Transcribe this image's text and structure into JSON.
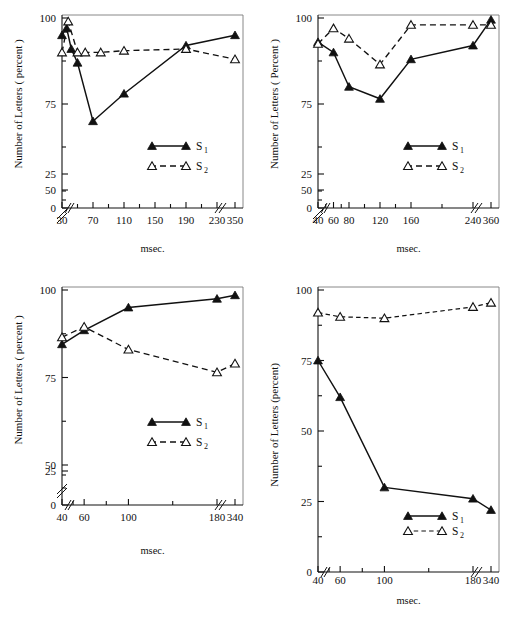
{
  "figure": {
    "background": "#ffffff",
    "panel_count": 4,
    "marker_colors": {
      "s1_fill": "#111111",
      "s2_fill": "#ffffff",
      "stroke": "#111111"
    }
  },
  "legend": {
    "s1_label": "S",
    "s1_sub": "1",
    "s2_label": "S",
    "s2_sub": "2"
  },
  "chart_data": [
    {
      "id": "panel-top-left",
      "type": "line",
      "title": "",
      "xlabel": "msec.",
      "ylabel": "Number of Letters ( percent )",
      "xticks": [
        "30",
        "70",
        "110",
        "150",
        "190",
        "230",
        "350"
      ],
      "xtick_values": [
        30,
        70,
        110,
        150,
        190,
        230,
        350
      ],
      "yticks": [
        "0",
        "25",
        "50",
        "75",
        "100"
      ],
      "ytick_values": [
        0,
        25,
        50,
        75,
        100
      ],
      "ylim": [
        0,
        105
      ],
      "xlim": [
        20,
        360
      ],
      "y_axis_break": true,
      "x_axis_break": true,
      "grid": false,
      "legend_position": "center-right",
      "series": [
        {
          "name": "S1",
          "style": "solid",
          "marker": "filled-triangle",
          "x": [
            30,
            36,
            42,
            50,
            70,
            110,
            190,
            350
          ],
          "values": [
            95,
            97,
            91,
            87,
            70,
            78,
            92,
            95
          ]
        },
        {
          "name": "S2",
          "style": "dashed",
          "marker": "open-triangle",
          "x": [
            30,
            38,
            50,
            60,
            80,
            110,
            190,
            350
          ],
          "values": [
            90,
            99,
            90,
            90,
            90,
            90.5,
            91,
            88
          ]
        }
      ]
    },
    {
      "id": "panel-top-right",
      "type": "line",
      "title": "",
      "xlabel": "msec.",
      "ylabel": "Number of Letters ( Percent )",
      "xticks": [
        "40",
        "60",
        "80",
        "120",
        "160",
        "240",
        "360"
      ],
      "xtick_values": [
        40,
        60,
        80,
        120,
        160,
        240,
        360
      ],
      "yticks": [
        "0",
        "25",
        "50",
        "75",
        "100"
      ],
      "ytick_values": [
        0,
        25,
        50,
        75,
        100
      ],
      "ylim": [
        0,
        105
      ],
      "xlim": [
        25,
        370
      ],
      "y_axis_break": true,
      "x_axis_break": true,
      "grid": false,
      "legend_position": "center-right",
      "series": [
        {
          "name": "S1",
          "style": "solid",
          "marker": "filled-triangle",
          "x": [
            40,
            60,
            80,
            120,
            160,
            240,
            360
          ],
          "values": [
            93,
            90,
            80,
            76.5,
            88,
            92,
            99.5
          ]
        },
        {
          "name": "S2",
          "style": "dashed",
          "marker": "open-triangle",
          "x": [
            40,
            60,
            80,
            120,
            160,
            240,
            360
          ],
          "values": [
            92.5,
            97,
            94,
            86.5,
            98,
            98,
            98
          ]
        }
      ]
    },
    {
      "id": "panel-bottom-left",
      "type": "line",
      "title": "",
      "xlabel": "msec.",
      "ylabel": "Number of Letters ( percent )",
      "xticks": [
        "40",
        "60",
        "100",
        "180",
        "340"
      ],
      "xtick_values": [
        40,
        60,
        100,
        180,
        340
      ],
      "yticks": [
        "0",
        "25",
        "50",
        "75",
        "100"
      ],
      "ytick_values": [
        0,
        25,
        50,
        75,
        100
      ],
      "ylim": [
        0,
        105
      ],
      "xlim": [
        25,
        355
      ],
      "y_axis_break": true,
      "x_axis_break": true,
      "grid": false,
      "legend_position": "center-right",
      "series": [
        {
          "name": "S1",
          "style": "solid",
          "marker": "filled-triangle",
          "x": [
            40,
            60,
            100,
            180,
            340
          ],
          "values": [
            84.5,
            88.5,
            95,
            97.5,
            98.5
          ]
        },
        {
          "name": "S2",
          "style": "dashed",
          "marker": "open-triangle",
          "x": [
            40,
            60,
            100,
            180,
            340
          ],
          "values": [
            86.5,
            89.5,
            83,
            76.5,
            79
          ]
        }
      ]
    },
    {
      "id": "panel-bottom-right",
      "type": "line",
      "title": "",
      "xlabel": "msec.",
      "ylabel": "Number of Letters (percent)",
      "xticks": [
        "40",
        "60",
        "100",
        "180",
        "340"
      ],
      "xtick_values": [
        40,
        60,
        100,
        180,
        340
      ],
      "yticks": [
        "0",
        "25",
        "50",
        "75",
        "100"
      ],
      "ytick_values": [
        0,
        25,
        50,
        75,
        100
      ],
      "ylim": [
        0,
        100
      ],
      "xlim": [
        25,
        355
      ],
      "y_axis_break": false,
      "x_axis_break": true,
      "grid": false,
      "legend_position": "lower-right",
      "series": [
        {
          "name": "S1",
          "style": "solid",
          "marker": "filled-triangle",
          "x": [
            40,
            60,
            100,
            180,
            340
          ],
          "values": [
            75,
            62,
            30,
            26,
            22
          ]
        },
        {
          "name": "S2",
          "style": "dashed",
          "marker": "open-triangle",
          "x": [
            40,
            60,
            100,
            180,
            340
          ],
          "values": [
            92,
            90.5,
            90,
            94,
            95.5
          ]
        }
      ]
    }
  ]
}
